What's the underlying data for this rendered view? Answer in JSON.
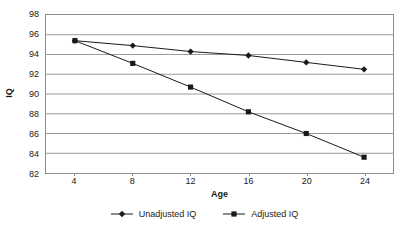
{
  "chart_data": {
    "type": "line",
    "title": "",
    "xlabel": "Age",
    "ylabel": "IQ",
    "x": [
      4,
      8,
      12,
      16,
      20,
      24
    ],
    "xticklabels": [
      "4",
      "8",
      "12",
      "16",
      "20",
      "24"
    ],
    "xlim": [
      2,
      26
    ],
    "ylim": [
      82,
      98
    ],
    "yticks": [
      82,
      84,
      86,
      88,
      90,
      92,
      94,
      96,
      98
    ],
    "yticklabels": [
      "82",
      "84",
      "86",
      "88",
      "90",
      "92",
      "94",
      "96",
      "98"
    ],
    "grid": "horizontal",
    "legend_position": "bottom-center",
    "series": [
      {
        "name": "Unadjusted IQ",
        "marker": "diamond",
        "color": "#1a1a1a",
        "values": [
          95.4,
          94.9,
          94.3,
          93.9,
          93.2,
          92.5
        ]
      },
      {
        "name": "Adjusted IQ",
        "marker": "square",
        "color": "#1a1a1a",
        "values": [
          95.4,
          93.1,
          90.7,
          88.2,
          86.0,
          83.6
        ]
      }
    ]
  },
  "axes": {
    "y_title": "IQ",
    "x_title": "Age"
  },
  "colors": {
    "line": "#1a1a1a",
    "gridline": "#9a9a9a",
    "border": "#8d8d8d",
    "background": "#ffffff",
    "text": "#1a1a1a"
  }
}
